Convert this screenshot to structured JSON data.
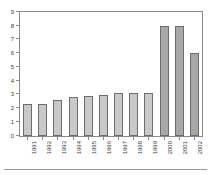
{
  "chart_data": {
    "type": "bar",
    "title": "",
    "subtitle": "",
    "xlabel": "",
    "ylabel": "",
    "categories": [
      "1991",
      "1992",
      "1993",
      "1994",
      "1995",
      "1996",
      "1997",
      "1998",
      "1999",
      "2000",
      "2001",
      "2002"
    ],
    "values": [
      2.3,
      2.3,
      2.6,
      2.8,
      2.9,
      3.0,
      3.1,
      3.1,
      3.1,
      8.0,
      8.0,
      6.0
    ],
    "ylim": [
      0,
      9
    ],
    "ytick_labels": [
      "0",
      "1",
      "2",
      "3",
      "4",
      "5",
      "6",
      "7",
      "8",
      "9"
    ],
    "ytick_values": [
      0,
      1,
      2,
      3,
      4,
      5,
      6,
      7,
      8,
      9
    ],
    "grid": false,
    "legend": "none",
    "bar_colors": [
      "#c9c9c9",
      "#c9c9c9",
      "#c9c9c9",
      "#c9c9c9",
      "#c9c9c9",
      "#c9c9c9",
      "#c9c9c9",
      "#c9c9c9",
      "#c9c9c9",
      "#a8a8a8",
      "#a8a8a8",
      "#a8a8a8"
    ],
    "bar_edge_color": "#6d6d6d",
    "axis_color": "#8a8a8a",
    "background_color": "#ffffff",
    "tick_label_rotation": -90
  }
}
